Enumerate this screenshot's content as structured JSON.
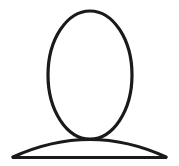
{
  "canvas": {
    "width": 179,
    "height": 166,
    "background_color": "#ffffff",
    "stroke_color": "#1a1a1a",
    "stroke_width": 3.2,
    "fill": "none"
  },
  "icon": {
    "semantic_name": "user-avatar-icon",
    "description": "Generic person silhouette outline: oval head above a curved shoulders arc",
    "style": "line-art outline, no fill",
    "alt_text": "User profile placeholder icon"
  },
  "shapes": {
    "head": {
      "name": "head-oval",
      "type": "ellipse-outline",
      "center_x": 90,
      "center_y": 75,
      "radius_x": 42,
      "radius_y": 64,
      "top_y": 11,
      "bottom_y": 139,
      "left_x": 48,
      "right_x": 132
    },
    "shoulders": {
      "name": "shoulders-arc",
      "type": "curve",
      "peak_x": 90,
      "peak_y": 130,
      "left_tip_x": 13,
      "left_tip_y": 157,
      "right_tip_x": 166,
      "right_tip_y": 157,
      "path": "M 13 157 Q 90 122 166 157"
    },
    "base": {
      "name": "base-line",
      "type": "line",
      "start_x": 13,
      "start_y": 157.5,
      "end_x": 166,
      "end_y": 157.5
    }
  }
}
